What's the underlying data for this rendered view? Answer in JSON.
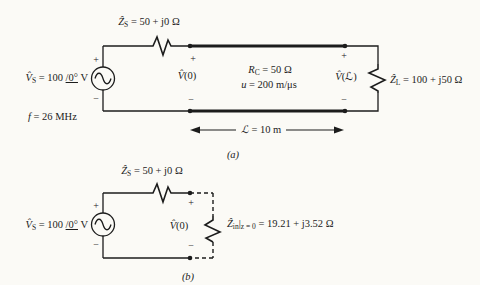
{
  "figure": {
    "background": "#fbfaf6",
    "ink": "#1c1c1c"
  },
  "symbols": {
    "plus": "+",
    "minus": "−"
  },
  "circuit_a": {
    "caption": "(a)",
    "source_voltage": {
      "sym": "V̂",
      "sub": "S",
      "eq": " = 100 ",
      "angle": "/0°",
      "unit": " V"
    },
    "frequency": {
      "sym": "f",
      "rest": " = 26 MHz"
    },
    "source_impedance": {
      "sym": "Ẑ",
      "sub": "S",
      "rest": " = 50 + j0 Ω"
    },
    "sending_voltage": {
      "sym": "V̂",
      "rest": "(0)"
    },
    "char_resistance": {
      "sym": "R",
      "sub": "C",
      "rest": " = 50 Ω"
    },
    "velocity": {
      "sym": "u",
      "rest": " = 200 m/μs"
    },
    "receiving_voltage": {
      "sym": "V̂",
      "rest": "(ℒ)"
    },
    "load_impedance": {
      "sym": "Ẑ",
      "sub": "L",
      "rest": " = 100 + j50 Ω"
    },
    "line_length": {
      "sym": "ℒ",
      "rest": " = 10 m"
    }
  },
  "circuit_b": {
    "caption": "(b)",
    "source_voltage": {
      "sym": "V̂",
      "sub": "S",
      "eq": " = 100 ",
      "angle": "/0°",
      "unit": " V"
    },
    "source_impedance": {
      "sym": "Ẑ",
      "sub": "S",
      "rest": " = 50 + j0 Ω"
    },
    "sending_voltage": {
      "sym": "V̂",
      "rest": "(0)"
    },
    "input_impedance": {
      "sym": "Ẑ",
      "sub": "in",
      "pipe": "|",
      "cond": "z = 0",
      "rest": " = 19.21 + j3.52 Ω"
    }
  }
}
